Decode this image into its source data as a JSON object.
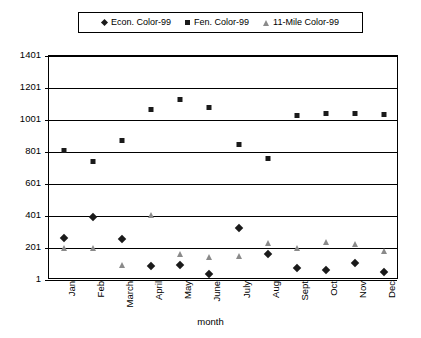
{
  "chart_data": {
    "type": "scatter",
    "title": "",
    "xlabel": "month",
    "ylabel": "",
    "ylim": [
      1,
      1401
    ],
    "yticks": [
      1,
      201,
      401,
      601,
      801,
      1001,
      1201,
      1401
    ],
    "grid": true,
    "legend_position": "top",
    "categories": [
      "Jan",
      "Feb",
      "March",
      "April",
      "May",
      "June",
      "July",
      "Aug",
      "Sept",
      "Oct",
      "Nov",
      "Dec"
    ],
    "series": [
      {
        "name": "Econ. Color-99",
        "marker": "diamond",
        "color": "#1a1a1a",
        "values": [
          282,
          410,
          276,
          104,
          112,
          55,
          340,
          180,
          90,
          80,
          120,
          65
        ]
      },
      {
        "name": "Fen. Color-99",
        "marker": "square",
        "color": "#1a1a1a",
        "values": [
          825,
          755,
          890,
          1080,
          1145,
          1095,
          865,
          775,
          1045,
          1060,
          1060,
          1050
        ]
      },
      {
        "name": "11-Mile Color-99",
        "marker": "triangle",
        "color": "#8a8a8a",
        "values": [
          210,
          208,
          100,
          415,
          172,
          150,
          160,
          240,
          205,
          245,
          230,
          190
        ]
      }
    ]
  },
  "legend": {
    "items": [
      {
        "label": "Econ. Color-99",
        "icon": "diamond-marker-icon"
      },
      {
        "label": "Fen. Color-99",
        "icon": "square-marker-icon"
      },
      {
        "label": "11-Mile Color-99",
        "icon": "triangle-marker-icon"
      }
    ]
  },
  "axes": {
    "y_tick_labels": [
      "1401",
      "1201",
      "1001",
      "801",
      "601",
      "401",
      "201",
      "1"
    ],
    "x_tick_labels": [
      "Jan",
      "Feb",
      "March",
      "April",
      "May",
      "June",
      "July",
      "Aug",
      "Sept",
      "Oct",
      "Nov",
      "Dec"
    ],
    "x_axis_title": "month"
  }
}
